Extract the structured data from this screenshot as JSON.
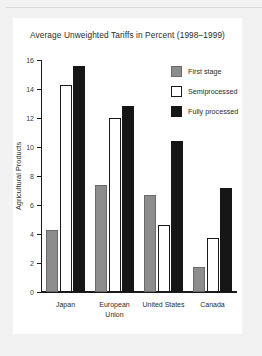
{
  "chart_data": {
    "type": "bar",
    "title": "Average Unweighted Tariffs in Percent (1998–1999)",
    "xlabel": "",
    "ylabel": "Agricultural Products",
    "ylim": [
      0,
      16
    ],
    "yticks": [
      0,
      2,
      4,
      6,
      8,
      10,
      12,
      14,
      16
    ],
    "ytick_labels": [
      "0",
      "2",
      "4",
      "6",
      "8",
      "10",
      "12",
      "14",
      "16"
    ],
    "grid": false,
    "legend_position": "top-right",
    "categories": [
      "Japan",
      "European Union",
      "United States",
      "Canada"
    ],
    "category_lines": [
      [
        "Japan"
      ],
      [
        "European",
        "Union"
      ],
      [
        "United States"
      ],
      [
        "Canada"
      ]
    ],
    "series": [
      {
        "name": "First stage",
        "color": "#8d8d8d",
        "values": [
          4.3,
          7.4,
          6.7,
          1.7
        ]
      },
      {
        "name": "Semiprocessed",
        "color": "#ffffff",
        "values": [
          14.3,
          12.0,
          4.6,
          3.75
        ]
      },
      {
        "name": "Fully processed",
        "color": "#161616",
        "values": [
          15.6,
          12.8,
          10.4,
          7.15
        ]
      }
    ]
  },
  "legend": {
    "items": [
      {
        "label": "First stage",
        "swatch": "first-stage"
      },
      {
        "label": "Semiprocessed",
        "swatch": "semiprocessed"
      },
      {
        "label": "Fully processed",
        "swatch": "fully-processed"
      }
    ]
  },
  "colors": {
    "page_background": "#f2f2f2",
    "panel_background": "#ffffff",
    "axis": "#1a1a1a",
    "text": "#2b2b2b",
    "first_stage": "#8d8d8d",
    "semiprocessed": "#ffffff",
    "fully_processed": "#161616"
  }
}
